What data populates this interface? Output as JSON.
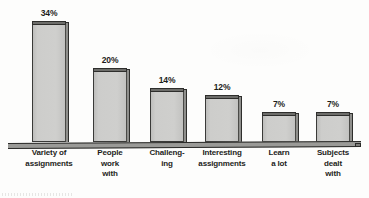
{
  "chart_data": {
    "type": "bar",
    "title": "",
    "subtitle": "",
    "xlabel": "",
    "ylabel": "",
    "ylim": [
      0,
      36
    ],
    "grid": false,
    "legend": "none",
    "value_suffix": "%",
    "categories": [
      "Variety of assignments",
      "People work with",
      "Challeng- ing",
      "Interesting assignments",
      "Learn a lot",
      "Subjects dealt with"
    ],
    "category_lines": [
      [
        "Variety of",
        "assignments"
      ],
      [
        "People",
        "work",
        "with"
      ],
      [
        "Challeng-",
        "ing"
      ],
      [
        "Interesting",
        "assignments"
      ],
      [
        "Learn",
        "a lot"
      ],
      [
        "Subjects",
        "dealt",
        "with"
      ]
    ],
    "values": [
      34,
      20,
      14,
      12,
      7,
      7
    ],
    "value_labels": [
      "34%",
      "20%",
      "14%",
      "12%",
      "7%",
      "7%"
    ],
    "colors": {
      "bar_fill": "#c9c9c7",
      "bar_outline": "#2e2e2c",
      "bar_top_face": "#6d6d6a",
      "text": "#1d1d1b",
      "background": "#fdfdfc",
      "baseline": "#9a9a97"
    }
  },
  "bars": [
    {
      "value_label": "34%",
      "lines": [
        "Variety of",
        "assignments"
      ],
      "left": 32,
      "width": 34,
      "height": 118
    },
    {
      "value_label": "20%",
      "lines": [
        "People",
        "work",
        "with"
      ],
      "left": 93,
      "width": 34,
      "height": 71
    },
    {
      "value_label": "14%",
      "lines": [
        "Challeng-",
        "ing"
      ],
      "left": 150,
      "width": 34,
      "height": 51
    },
    {
      "value_label": "12%",
      "lines": [
        "Interesting",
        "assignments"
      ],
      "left": 205,
      "width": 34,
      "height": 44
    },
    {
      "value_label": "7%",
      "lines": [
        "Learn",
        "a lot"
      ],
      "left": 262,
      "width": 34,
      "height": 27
    },
    {
      "value_label": "7%",
      "lines": [
        "Subjects",
        "dealt",
        "with"
      ],
      "left": 316,
      "width": 34,
      "height": 27
    }
  ]
}
